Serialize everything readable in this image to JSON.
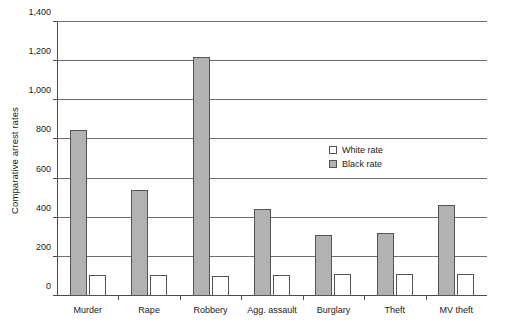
{
  "chart_data": {
    "type": "bar",
    "title": "",
    "xlabel": "",
    "ylabel": "Comparative arrest rates",
    "ylim": [
      0,
      1400
    ],
    "ytick_step": 200,
    "grid": true,
    "legend_position": "inside-right",
    "categories": [
      "Murder",
      "Rape",
      "Robbery",
      "Agg. assault",
      "Burglary",
      "Theft",
      "MV theft"
    ],
    "ytick_labels": [
      "0",
      "200",
      "400",
      "600",
      "800",
      "1,000",
      "1,200",
      "1,400"
    ],
    "ytick_values": [
      0,
      200,
      400,
      600,
      800,
      1000,
      1200,
      1400
    ],
    "series": [
      {
        "name": "White rate",
        "fill": "#ffffff",
        "values": [
          105,
          108,
          100,
          108,
          110,
          110,
          112
        ]
      },
      {
        "name": "Black rate",
        "fill": "#b2b2b2",
        "values": [
          850,
          540,
          1220,
          445,
          310,
          320,
          465
        ]
      }
    ]
  },
  "legend": {
    "entries": [
      {
        "label": "White rate",
        "swatch": "white-rate"
      },
      {
        "label": "Black rate",
        "swatch": "black-rate"
      }
    ]
  },
  "colors": {
    "bar_black_rate": "#b2b2b2",
    "bar_white_rate": "#ffffff",
    "bar_outline": "#545454",
    "gridline": "#6e6e6e",
    "axis": "#4a4a4a",
    "text": "#1a1a1a",
    "background": "#ffffff"
  }
}
